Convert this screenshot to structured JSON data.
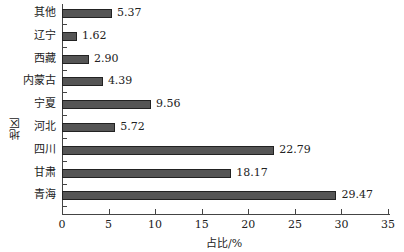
{
  "chart_data": {
    "type": "bar",
    "orientation": "horizontal",
    "title": "",
    "xlabel": "占比/%",
    "ylabel": "地区",
    "xlim": [
      0,
      35
    ],
    "xticks": [
      "0",
      "5",
      "10",
      "15",
      "20",
      "25",
      "30",
      "35"
    ],
    "grid": false,
    "categories": [
      "其他",
      "辽宁",
      "西藏",
      "内蒙古",
      "宁夏",
      "河北",
      "四川",
      "甘肃",
      "青海"
    ],
    "values": [
      5.37,
      1.62,
      2.9,
      4.39,
      9.56,
      5.72,
      22.79,
      18.17,
      29.47
    ],
    "value_labels": [
      "5.37",
      "1.62",
      "2.90",
      "4.39",
      "9.56",
      "5.72",
      "22.79",
      "18.17",
      "29.47"
    ],
    "bar_color": "#555555"
  }
}
